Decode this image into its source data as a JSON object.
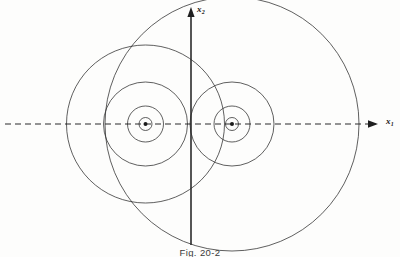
{
  "figure": {
    "caption": "Fig. 20-2",
    "background_color": "#fdfdfc",
    "line_color": "#2b2b2b"
  },
  "axes": {
    "vertical": {
      "name": "x2",
      "label_text": "x",
      "label_subscript": "2",
      "style": "solid",
      "arrow": "up",
      "x": 191,
      "y_top": 8,
      "y_bottom": 245
    },
    "horizontal": {
      "name": "x1",
      "label_text": "x",
      "label_subscript": "1",
      "style": "dashed",
      "arrow": "right",
      "y": 124,
      "x_left": 5,
      "x_right": 378
    }
  },
  "chart_data": {
    "type": "scatter",
    "title": "Fig. 20-2",
    "xlabel": "x1",
    "ylabel": "x2",
    "grid": false,
    "legend": null,
    "axis_origin": [
      191,
      124
    ],
    "series": [
      {
        "name": "left-cluster",
        "center": [
          145.5,
          124
        ],
        "center_marker": {
          "shape": "dot",
          "radius": 2.0
        },
        "contour_radii": [
          6.5,
          18,
          42,
          79
        ]
      },
      {
        "name": "right-cluster",
        "center": [
          232,
          124
        ],
        "center_marker": {
          "shape": "dot",
          "radius": 2.0
        },
        "contour_radii": [
          6.5,
          18,
          42,
          127
        ]
      }
    ]
  }
}
